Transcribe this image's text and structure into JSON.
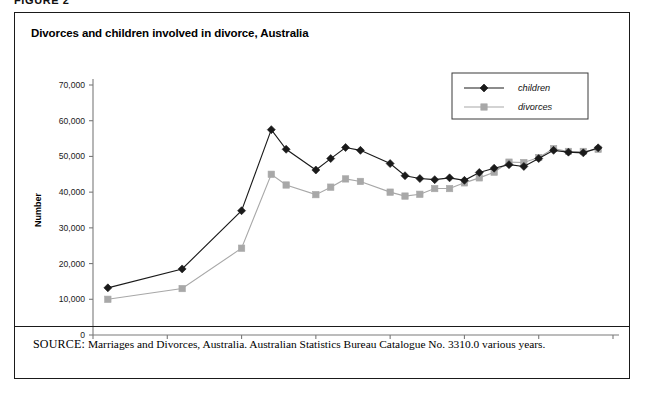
{
  "figure_tag": "FIGURE 2",
  "figure": {
    "title": "Divorces and children involved in divorce, Australia",
    "source_label": "SOURCE:",
    "source_text": "Marriages and Divorces, Australia. Australian Statistics Bureau Catalogue No. 3310.0 various years."
  },
  "chart_data": {
    "type": "line",
    "title": "Divorces and children involved in divorce, Australia",
    "xlabel": "Year",
    "ylabel": "Number",
    "xlim": [
      1965,
      2000
    ],
    "ylim": [
      0,
      70000
    ],
    "xticks": [
      1965,
      1970,
      1975,
      1980,
      1985,
      1990,
      1995,
      2000
    ],
    "xtick_labels": [
      "1965",
      "1970",
      "1975",
      "1980",
      "1985",
      "1990",
      "1995",
      "2000"
    ],
    "yticks": [
      0,
      10000,
      20000,
      30000,
      40000,
      50000,
      60000,
      70000
    ],
    "ytick_labels": [
      "0",
      "10,000",
      "20,000",
      "30,000",
      "40,000",
      "50,000",
      "60,000",
      "70,000"
    ],
    "grid": false,
    "legend_position": "top-right",
    "series": [
      {
        "name": "children",
        "color": "#1a1a1a",
        "marker": "diamond",
        "x": [
          1966,
          1971,
          1975,
          1977,
          1978,
          1980,
          1981,
          1982,
          1983,
          1985,
          1986,
          1987,
          1988,
          1989,
          1990,
          1991,
          1992,
          1993,
          1994,
          1995,
          1996,
          1997,
          1998,
          1999
        ],
        "values": [
          13200,
          18500,
          34800,
          57500,
          52000,
          46200,
          49400,
          52500,
          51700,
          48000,
          44600,
          43800,
          43500,
          44000,
          43300,
          45500,
          46700,
          47700,
          47200,
          49400,
          51700,
          51200,
          51000,
          52400
        ]
      },
      {
        "name": "divorces",
        "color": "#a8a8a8",
        "marker": "square",
        "x": [
          1966,
          1971,
          1975,
          1977,
          1978,
          1980,
          1981,
          1982,
          1983,
          1985,
          1986,
          1987,
          1988,
          1989,
          1990,
          1991,
          1992,
          1993,
          1994,
          1995,
          1996,
          1997,
          1998,
          1999
        ],
        "values": [
          10000,
          13000,
          24300,
          45000,
          42000,
          39300,
          41400,
          43700,
          43000,
          40000,
          38900,
          39400,
          41000,
          41000,
          42600,
          44000,
          45600,
          48400,
          48300,
          49700,
          52200,
          51400,
          51400,
          52000
        ]
      }
    ]
  },
  "legend": {
    "items": [
      {
        "label": "children"
      },
      {
        "label": "divorces"
      }
    ]
  }
}
